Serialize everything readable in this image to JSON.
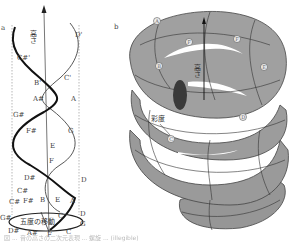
{
  "figure": {
    "panel_a": {
      "panel_label": "a",
      "axis_label": "高さ",
      "ellipse_label": "五度の移動",
      "point_labels": {
        "D_top": "D'",
        "Cs_top": "C#'",
        "C_top": "C'",
        "B_top": "B'",
        "As_top": "A#",
        "A_right": "A",
        "Gs_left": "G#",
        "Fs_left": "F#",
        "G_right": "G",
        "E_mid": "E",
        "F_mid": "F",
        "Ds_left": "D#",
        "D_right": "D",
        "Cs_left": "C#",
        "C_left": "C#",
        "Fs_low": "F#",
        "B_low": "B",
        "E_low": "E",
        "A_low": "A",
        "Gs_base": "G#",
        "C_base_in": "C",
        "D_base": "D",
        "G_base": "G",
        "Ds_base": "D#",
        "As_base": "A#",
        "F_base": "F",
        "C_base": "C"
      }
    },
    "panel_b": {
      "panel_label": "b",
      "axis_label": "高さ",
      "chroma_label": "彩度",
      "nodes": [
        "A",
        "F",
        "F",
        "B",
        "E",
        "D",
        "C"
      ]
    },
    "caption": "図 ... 音の高さの二次元表現 ... 螺旋 ... (illegible)"
  }
}
